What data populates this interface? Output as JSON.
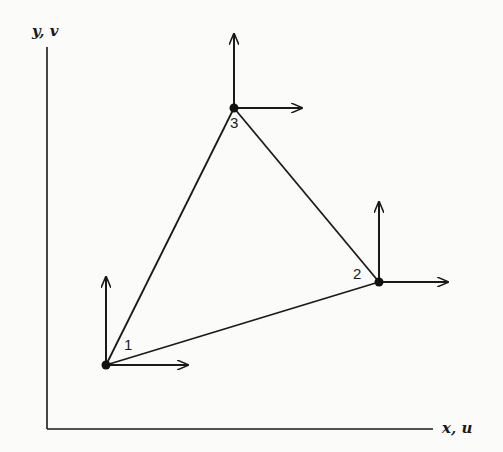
{
  "figure": {
    "axes": {
      "y_label": "y, v",
      "x_label": "x, u"
    },
    "colors": {
      "ink": "#1a1a1a",
      "background": "#fbfbfa"
    },
    "nodes": [
      {
        "id": "1",
        "label": "1",
        "x": 106,
        "y": 365
      },
      {
        "id": "2",
        "label": "2",
        "x": 379,
        "y": 282
      },
      {
        "id": "3",
        "label": "3",
        "x": 234,
        "y": 108
      }
    ],
    "edges": [
      [
        "1",
        "2"
      ],
      [
        "2",
        "3"
      ],
      [
        "3",
        "1"
      ]
    ],
    "dof_arrows": "each node has a horizontal (u) and vertical (v) displacement arrow"
  }
}
